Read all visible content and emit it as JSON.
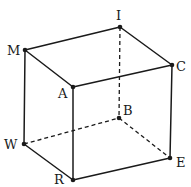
{
  "diagram": {
    "colors": {
      "line": "#1a1a1a",
      "background": "#ffffff"
    },
    "vertices": [
      {
        "id": "I",
        "label": "I",
        "x": 120,
        "y": 27,
        "lx": 116,
        "ly": 20
      },
      {
        "id": "M",
        "label": "M",
        "x": 25,
        "y": 50,
        "lx": 7,
        "ly": 55
      },
      {
        "id": "C",
        "label": "C",
        "x": 172,
        "y": 65,
        "lx": 176,
        "ly": 71
      },
      {
        "id": "A",
        "label": "A",
        "x": 73,
        "y": 87,
        "lx": 58,
        "ly": 98
      },
      {
        "id": "B",
        "label": "B",
        "x": 119,
        "y": 118,
        "lx": 123,
        "ly": 115
      },
      {
        "id": "W",
        "label": "W",
        "x": 24,
        "y": 144,
        "lx": 4,
        "ly": 149
      },
      {
        "id": "E",
        "label": "E",
        "x": 170,
        "y": 158,
        "lx": 176,
        "ly": 167
      },
      {
        "id": "R",
        "label": "R",
        "x": 73,
        "y": 180,
        "lx": 54,
        "ly": 184
      }
    ],
    "edges": [
      {
        "from": "M",
        "to": "I",
        "style": "solid"
      },
      {
        "from": "I",
        "to": "C",
        "style": "solid"
      },
      {
        "from": "C",
        "to": "A",
        "style": "solid"
      },
      {
        "from": "A",
        "to": "M",
        "style": "solid"
      },
      {
        "from": "M",
        "to": "W",
        "style": "solid"
      },
      {
        "from": "A",
        "to": "R",
        "style": "solid"
      },
      {
        "from": "C",
        "to": "E",
        "style": "solid"
      },
      {
        "from": "W",
        "to": "R",
        "style": "solid"
      },
      {
        "from": "R",
        "to": "E",
        "style": "solid"
      },
      {
        "from": "I",
        "to": "B",
        "style": "dashed"
      },
      {
        "from": "W",
        "to": "B",
        "style": "dashed"
      },
      {
        "from": "B",
        "to": "E",
        "style": "dashed"
      }
    ]
  }
}
